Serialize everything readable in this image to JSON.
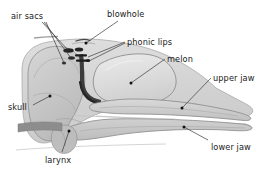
{
  "figure": {
    "background_color": "#ffffff",
    "label_color": "#1a1a1a",
    "leader_color": "#3a3a3a"
  },
  "labels": {
    "air_sacs": "air sacs",
    "blowhole": "blowhole",
    "phonic_lips": "phonic lips",
    "melon": "melon",
    "upper_jaw": "upper jaw",
    "lower_jaw": "lower jaw",
    "skull": "skull",
    "larynx": "larynx"
  },
  "structures": {
    "skull": {
      "name": "skull",
      "fill": "#c9c9c9"
    },
    "melon": {
      "name": "melon",
      "fill": "#dcdcdc"
    },
    "upper_jaw": {
      "name": "upper-jaw",
      "fill": "#cccccc"
    },
    "lower_jaw": {
      "name": "lower-jaw",
      "fill": "#c4c4c4"
    },
    "head_outline": {
      "name": "head-outline",
      "fill": "#d2d2d2"
    },
    "air_sacs": {
      "name": "air-sacs",
      "fill": "#2a2a2a"
    },
    "phonic_lips": {
      "name": "phonic-lips",
      "fill": "#1f1f1f"
    },
    "larynx": {
      "name": "larynx",
      "fill": "#b8b8b8"
    },
    "nasal_passage": {
      "name": "nasal-passage",
      "fill": "#4a4a4a"
    }
  }
}
